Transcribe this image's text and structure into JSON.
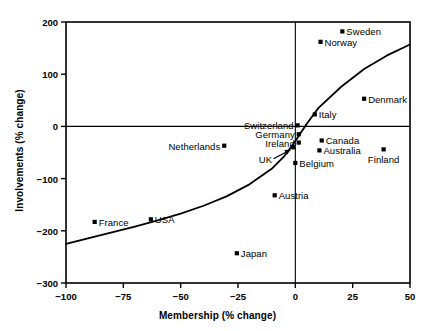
{
  "chart_data": {
    "type": "scatter",
    "title": "",
    "xlabel": "Membership (% change)",
    "ylabel": "Involvements (% change)",
    "xlim": [
      -100,
      50
    ],
    "ylim": [
      -300,
      200
    ],
    "xticks": [
      "-100",
      "-75",
      "-50",
      "-25",
      "0",
      "25",
      "50"
    ],
    "xtick_values": [
      -100,
      -75,
      -50,
      -25,
      0,
      25,
      50
    ],
    "yticks": [
      "200",
      "100",
      "0",
      "-100",
      "-200",
      "-300"
    ],
    "ytick_values": [
      200,
      100,
      0,
      -100,
      -200,
      -300
    ],
    "grid": false,
    "legend": "none",
    "reference_lines": [
      {
        "name": "zero-horizontal",
        "axis": "y",
        "value": 0
      },
      {
        "name": "zero-vertical",
        "axis": "x",
        "value": 0
      }
    ],
    "fit_curve": {
      "name": "trend-curve",
      "points": [
        {
          "x": -100,
          "y": -225
        },
        {
          "x": -90,
          "y": -214
        },
        {
          "x": -80,
          "y": -203
        },
        {
          "x": -70,
          "y": -192
        },
        {
          "x": -60,
          "y": -180
        },
        {
          "x": -50,
          "y": -167
        },
        {
          "x": -40,
          "y": -152
        },
        {
          "x": -30,
          "y": -134
        },
        {
          "x": -20,
          "y": -111
        },
        {
          "x": -10,
          "y": -80
        },
        {
          "x": -5,
          "y": -58
        },
        {
          "x": 0,
          "y": -28
        },
        {
          "x": 5,
          "y": 5
        },
        {
          "x": 10,
          "y": 35
        },
        {
          "x": 20,
          "y": 76
        },
        {
          "x": 30,
          "y": 110
        },
        {
          "x": 40,
          "y": 136
        },
        {
          "x": 50,
          "y": 157
        }
      ]
    },
    "points": [
      {
        "label": "Sweden",
        "x": 20.5,
        "y": 182,
        "label_pos": "right"
      },
      {
        "label": "Norway",
        "x": 11.0,
        "y": 162,
        "label_pos": "right"
      },
      {
        "label": "Denmark",
        "x": 30.0,
        "y": 53,
        "label_pos": "right"
      },
      {
        "label": "Italy",
        "x": 8.5,
        "y": 23,
        "label_pos": "right"
      },
      {
        "label": "Switzerland",
        "x": 1.0,
        "y": 2,
        "label_pos": "left"
      },
      {
        "label": "Germany",
        "x": 1.5,
        "y": -15,
        "label_pos": "left"
      },
      {
        "label": "Ireland",
        "x": 1.5,
        "y": -31,
        "label_pos": "left"
      },
      {
        "label": "Canada",
        "x": 11.5,
        "y": -27,
        "label_pos": "right"
      },
      {
        "label": "Australia",
        "x": 10.5,
        "y": -46,
        "label_pos": "right"
      },
      {
        "label": "Finland",
        "x": 38.5,
        "y": -44,
        "label_pos": "below"
      },
      {
        "label": "UK",
        "x": -1.0,
        "y": -40,
        "label_pos": "arrow"
      },
      {
        "label": "Belgium",
        "x": 0.0,
        "y": -70,
        "label_pos": "right"
      },
      {
        "label": "Netherlands",
        "x": -31.0,
        "y": -37,
        "label_pos": "left"
      },
      {
        "label": "Austria",
        "x": -9.0,
        "y": -132,
        "label_pos": "right"
      },
      {
        "label": "France",
        "x": -87.5,
        "y": -183,
        "label_pos": "right"
      },
      {
        "label": "USA",
        "x": -63.0,
        "y": -178,
        "label_pos": "right"
      },
      {
        "label": "Japan",
        "x": -25.5,
        "y": -243,
        "label_pos": "right"
      }
    ]
  },
  "colors": {
    "axis": "#000000",
    "marker": "#000000",
    "curve": "#000000",
    "background": "#ffffff"
  }
}
